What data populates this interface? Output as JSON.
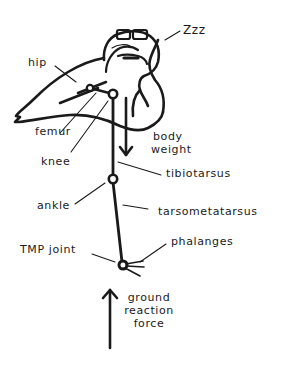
{
  "diagram": {
    "labels": {
      "zzz": "Zzz",
      "hip": "hip",
      "femur": "femur",
      "knee": "knee",
      "body_weight_line1": "body",
      "body_weight_line2": "weight",
      "tibiotarsus": "tibiotarsus",
      "ankle": "ankle",
      "tarsometatarsus": "tarsometatarsus",
      "tmp_joint": "TMP joint",
      "phalanges": "phalanges",
      "grf_line1": "ground",
      "grf_line2": "reaction",
      "grf_line3": "force"
    },
    "arrows": {
      "body_weight": "down",
      "ground_reaction_force": "up"
    },
    "colors": {
      "ink": "#1a1a1a",
      "background": "#ffffff"
    }
  }
}
